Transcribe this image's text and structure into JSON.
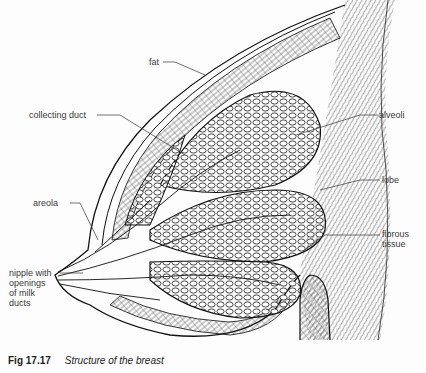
{
  "figure": {
    "number": "Fig 17.17",
    "title": "Structure of the breast"
  },
  "labels": [
    {
      "id": "fat",
      "text": "fat"
    },
    {
      "id": "collecting-duct",
      "text": "collecting duct"
    },
    {
      "id": "alveoli",
      "text": "alveoli"
    },
    {
      "id": "lobe",
      "text": "lobe"
    },
    {
      "id": "areola",
      "text": "areola"
    },
    {
      "id": "fibrous-tissue",
      "text": "fibrous\ntissue"
    },
    {
      "id": "nipple",
      "text": "nipple with\nopenings\nof milk\nducts"
    }
  ],
  "colors": {
    "ink": "#1a1a1a",
    "background": "#fdfdfd"
  }
}
